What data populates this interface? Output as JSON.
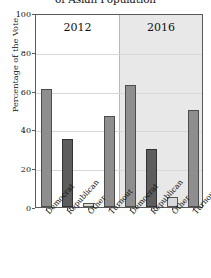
{
  "chart_data": {
    "type": "bar",
    "title": "of Asian Population",
    "xlabel": "",
    "ylabel": "Percentage of the Vote",
    "ylim": [
      0,
      100
    ],
    "yticks": [
      0,
      20,
      40,
      60,
      80,
      100
    ],
    "ytick_labels": [
      "0",
      "20",
      "40",
      "60",
      "80",
      "100"
    ],
    "grid": true,
    "legend": "none",
    "panels": [
      {
        "label": "2012",
        "background": "#ffffff",
        "categories": [
          "Democrat",
          "Republican",
          "Other",
          "Turnout"
        ],
        "values": [
          61,
          35,
          2,
          47
        ],
        "styles": [
          "light",
          "dark",
          "pale",
          "light"
        ]
      },
      {
        "label": "2016",
        "background": "#e8e8e8",
        "categories": [
          "Democrat",
          "Republican",
          "Other",
          "Turnout"
        ],
        "values": [
          63,
          30,
          5,
          50
        ],
        "styles": [
          "light",
          "dark",
          "pale",
          "light"
        ]
      }
    ],
    "colors": {
      "light_bar": "#8e8e8e",
      "dark_bar": "#5d5d5d",
      "pale_bar": "#d9d9d9",
      "axis": "#5a5a5a",
      "grid": "#d8d8d8",
      "panel_2016_bg": "#e8e8e8"
    }
  }
}
